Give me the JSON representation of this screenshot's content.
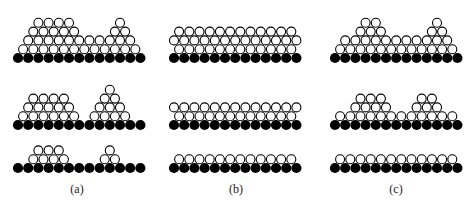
{
  "figure": {
    "ball_diameter": 10.2,
    "layer_height": 8.8,
    "substrate_count": 13,
    "colors": {
      "substrate": "#000000",
      "adatom_fill": "#ffffff",
      "adatom_stroke": "#000000"
    },
    "panels": [
      {
        "label": "(a)",
        "label_x": 77,
        "base_x0": 18,
        "rows": [
          {
            "base_y": 58,
            "layers": [
              [
                0.5,
                1.5,
                2.5,
                3.5,
                4.5,
                5.5,
                6.5,
                7.5,
                8.5,
                9.5,
                10.5,
                11.5
              ],
              [
                1,
                2,
                3,
                4,
                5,
                6,
                7,
                8,
                9,
                10,
                11
              ],
              [
                1.5,
                2.5,
                3.5,
                4.5,
                5.5,
                9.5,
                10.5
              ],
              [
                2,
                3,
                4,
                5,
                10
              ]
            ]
          },
          {
            "base_y": 125,
            "layers": [
              [
                0.5,
                1.5,
                2.5,
                3.5,
                4.5,
                5.5,
                7.5,
                8.5,
                9.5,
                10.5
              ],
              [
                1,
                2,
                3,
                4,
                5,
                8,
                9,
                10
              ],
              [
                1.5,
                2.5,
                3.5,
                4.5,
                8.5,
                9.5
              ],
              [
                9
              ]
            ]
          },
          {
            "base_y": 168,
            "layers": [
              [
                1.5,
                2.5,
                3.5,
                4.5,
                8.5,
                9.5
              ],
              [
                2,
                3,
                4,
                9
              ]
            ]
          }
        ]
      },
      {
        "label": "(b)",
        "label_x": 236,
        "base_x0": 174,
        "rows": [
          {
            "base_y": 58,
            "layers": [
              [
                0.5,
                1.5,
                2.5,
                3.5,
                4.5,
                5.5,
                6.5,
                7.5,
                8.5,
                9.5,
                10.5,
                11.5
              ],
              [
                0,
                1,
                2,
                3,
                4,
                5,
                6,
                7,
                8,
                9,
                10,
                11,
                12
              ],
              [
                0.5,
                1.5,
                2.5,
                3.5,
                4.5,
                5.5,
                6.5,
                7.5,
                8.5,
                9.5,
                10.5,
                11.5
              ]
            ]
          },
          {
            "base_y": 125,
            "layers": [
              [
                0.5,
                1.5,
                2.5,
                3.5,
                4.5,
                5.5,
                6.5,
                7.5,
                8.5,
                9.5,
                10.5,
                11.5
              ],
              [
                0,
                1,
                2,
                3,
                4,
                5,
                6,
                7,
                8,
                9,
                10,
                11,
                12
              ]
            ]
          },
          {
            "base_y": 168,
            "layers": [
              [
                0.5,
                1.5,
                2.5,
                3.5,
                4.5,
                5.5,
                6.5,
                7.5,
                8.5,
                9.5,
                10.5,
                11.5
              ]
            ]
          }
        ]
      },
      {
        "label": "(c)",
        "label_x": 396,
        "base_x0": 335,
        "rows": [
          {
            "base_y": 58,
            "layers": [
              [
                0.5,
                1.5,
                2.5,
                3.5,
                4.5,
                5.5,
                6.5,
                7.5,
                8.5,
                9.5,
                10.5,
                11.5
              ],
              [
                1,
                2,
                3,
                4,
                5,
                6,
                7,
                8,
                9,
                10,
                11
              ],
              [
                2.5,
                3.5,
                4.5,
                9.5,
                10.5
              ],
              [
                3,
                4,
                10
              ]
            ]
          },
          {
            "base_y": 125,
            "layers": [
              [
                0.5,
                1.5,
                2.5,
                3.5,
                4.5,
                5.5,
                6.5,
                7.5,
                8.5,
                9.5,
                10.5,
                11.5
              ],
              [
                2,
                3,
                4,
                5,
                8,
                9,
                10
              ],
              [
                2.5,
                3.5,
                4.5,
                8.5,
                9.5
              ]
            ]
          },
          {
            "base_y": 168,
            "layers": [
              [
                0.5,
                1.5,
                2.5,
                3.5,
                4.5,
                5.5,
                6.5,
                7.5,
                8.5,
                9.5,
                10.5,
                11.5
              ]
            ]
          }
        ]
      }
    ]
  }
}
